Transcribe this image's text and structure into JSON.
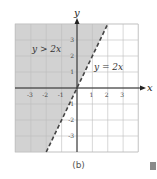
{
  "chart_data": {
    "type": "line",
    "title": "",
    "xlabel": "x",
    "ylabel": "y",
    "xlim": [
      -4,
      4
    ],
    "ylim": [
      -4,
      4
    ],
    "grid": true,
    "x_ticks": [
      "-3",
      "-2",
      "-1",
      "1",
      "2",
      "3"
    ],
    "y_ticks": [
      "3",
      "2",
      "1",
      "-1",
      "-2",
      "-3"
    ],
    "series": [
      {
        "name": "y = 2x",
        "style": "dashed",
        "x": [
          -2,
          2
        ],
        "y": [
          -4,
          4
        ]
      }
    ],
    "shaded_region": {
      "label": "y > 2x",
      "description": "region above/left of y = 2x",
      "color": "#d0d0d0"
    },
    "annotations": [
      {
        "text": "y > 2x",
        "x": -2.5,
        "y": 2.6
      },
      {
        "text": "y = 2x",
        "x": 1.7,
        "y": 1.4
      }
    ]
  },
  "labels": {
    "x_axis": "x",
    "y_axis": "y",
    "inequality": "y > 2x",
    "line": "y = 2x",
    "caption": "(b)"
  },
  "ticks": {
    "x": [
      {
        "v": -3,
        "t": "-3"
      },
      {
        "v": -2,
        "t": "-2"
      },
      {
        "v": -1,
        "t": "-1"
      },
      {
        "v": 1,
        "t": "1"
      },
      {
        "v": 2,
        "t": "2"
      },
      {
        "v": 3,
        "t": "3"
      }
    ],
    "y": [
      {
        "v": 3,
        "t": "3"
      },
      {
        "v": 2,
        "t": "2"
      },
      {
        "v": 1,
        "t": "1"
      },
      {
        "v": -1,
        "t": "-1"
      },
      {
        "v": -2,
        "t": "-2"
      },
      {
        "v": -3,
        "t": "-3"
      }
    ]
  },
  "colors": {
    "shade": "#d2d2d2",
    "grid": "#c8c8c8",
    "axis": "#222222",
    "line": "#444444"
  }
}
